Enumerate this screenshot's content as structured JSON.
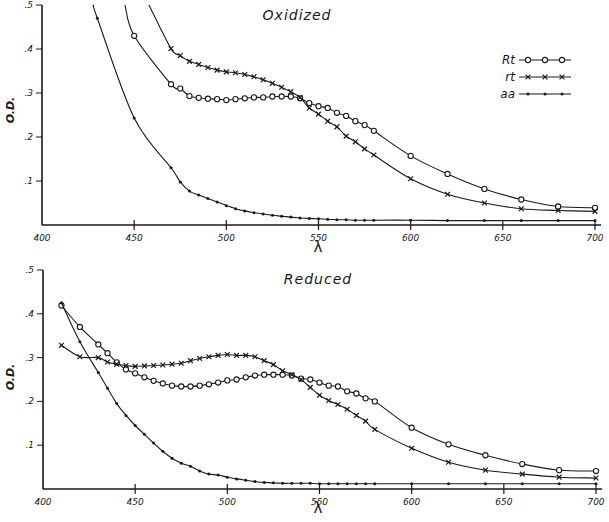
{
  "figure": {
    "panels": [
      {
        "id": "oxidized",
        "title": "Oxidized"
      },
      {
        "id": "reduced",
        "title": "Reduced"
      }
    ],
    "ylabel": "O.D.",
    "xlabel": "λ",
    "legend": [
      {
        "label": "Rt",
        "marker": "circle"
      },
      {
        "label": "rt",
        "marker": "cross"
      },
      {
        "label": "aa",
        "marker": "dot"
      }
    ]
  },
  "chart_data": [
    {
      "type": "line",
      "title": "Oxidized",
      "xlabel": "λ",
      "ylabel": "O.D.",
      "xlim": [
        400,
        700
      ],
      "ylim": [
        0,
        0.5
      ],
      "x_ticks": [
        400,
        450,
        500,
        550,
        600,
        650,
        700
      ],
      "x_tick_labels": [
        "400",
        "450",
        "500",
        "550",
        "600",
        "650",
        "700"
      ],
      "y_ticks": [
        0.1,
        0.2,
        0.3,
        0.4,
        0.5
      ],
      "y_tick_labels": [
        ".1",
        ".2",
        ".3",
        ".4",
        ".5"
      ],
      "grid": false,
      "legend_position": "upper right",
      "series": [
        {
          "name": "Rt",
          "marker": "circle",
          "x": [
            445,
            450,
            470,
            475,
            480,
            485,
            490,
            495,
            500,
            505,
            510,
            515,
            520,
            525,
            530,
            535,
            540,
            545,
            550,
            555,
            560,
            565,
            570,
            575,
            580,
            600,
            620,
            640,
            660,
            680,
            700
          ],
          "y": [
            0.5,
            0.43,
            0.32,
            0.31,
            0.293,
            0.289,
            0.287,
            0.286,
            0.284,
            0.286,
            0.288,
            0.29,
            0.29,
            0.292,
            0.292,
            0.292,
            0.288,
            0.277,
            0.27,
            0.266,
            0.255,
            0.248,
            0.236,
            0.227,
            0.214,
            0.157,
            0.116,
            0.082,
            0.058,
            0.042,
            0.039
          ]
        },
        {
          "name": "rt",
          "marker": "cross",
          "x": [
            458,
            470,
            475,
            480,
            485,
            490,
            495,
            500,
            505,
            510,
            515,
            520,
            525,
            530,
            535,
            540,
            545,
            550,
            555,
            560,
            565,
            570,
            575,
            580,
            600,
            620,
            640,
            660,
            680,
            700
          ],
          "y": [
            0.5,
            0.401,
            0.385,
            0.372,
            0.365,
            0.358,
            0.352,
            0.348,
            0.346,
            0.342,
            0.337,
            0.33,
            0.322,
            0.313,
            0.303,
            0.29,
            0.266,
            0.252,
            0.236,
            0.223,
            0.202,
            0.189,
            0.173,
            0.159,
            0.105,
            0.07,
            0.05,
            0.037,
            0.033,
            0.031
          ]
        },
        {
          "name": "aa",
          "marker": "dot",
          "x": [
            428,
            430,
            450,
            470,
            475,
            480,
            485,
            490,
            495,
            500,
            505,
            510,
            515,
            520,
            525,
            530,
            535,
            540,
            545,
            550,
            555,
            560,
            565,
            570,
            575,
            580,
            600,
            620,
            640,
            660,
            680,
            700
          ],
          "y": [
            0.5,
            0.47,
            0.243,
            0.13,
            0.098,
            0.077,
            0.068,
            0.06,
            0.052,
            0.044,
            0.037,
            0.032,
            0.028,
            0.025,
            0.022,
            0.02,
            0.018,
            0.016,
            0.015,
            0.014,
            0.013,
            0.012,
            0.012,
            0.011,
            0.011,
            0.011,
            0.011,
            0.01,
            0.01,
            0.01,
            0.01,
            0.01
          ]
        }
      ]
    },
    {
      "type": "line",
      "title": "Reduced",
      "xlabel": "λ",
      "ylabel": "O.D.",
      "xlim": [
        400,
        700
      ],
      "ylim": [
        0,
        0.5
      ],
      "x_ticks": [
        400,
        450,
        500,
        550,
        600,
        650,
        700
      ],
      "x_tick_labels": [
        "400",
        "450",
        "500",
        "550",
        "600",
        "650",
        "700"
      ],
      "y_ticks": [
        0.1,
        0.2,
        0.3,
        0.4,
        0.5
      ],
      "y_tick_labels": [
        ".1",
        ".2",
        ".3",
        ".4",
        ".5"
      ],
      "grid": false,
      "series": [
        {
          "name": "Rt",
          "marker": "circle",
          "x": [
            410,
            420,
            430,
            435,
            440,
            445,
            450,
            455,
            460,
            465,
            470,
            475,
            480,
            485,
            490,
            495,
            500,
            505,
            510,
            515,
            520,
            525,
            530,
            535,
            540,
            545,
            550,
            555,
            560,
            565,
            570,
            575,
            580,
            600,
            620,
            640,
            660,
            680,
            700
          ],
          "y": [
            0.419,
            0.37,
            0.33,
            0.31,
            0.289,
            0.273,
            0.264,
            0.255,
            0.247,
            0.241,
            0.236,
            0.234,
            0.234,
            0.236,
            0.239,
            0.243,
            0.248,
            0.25,
            0.255,
            0.259,
            0.261,
            0.261,
            0.261,
            0.259,
            0.252,
            0.25,
            0.243,
            0.236,
            0.234,
            0.223,
            0.218,
            0.207,
            0.2,
            0.14,
            0.102,
            0.077,
            0.057,
            0.043,
            0.041
          ]
        },
        {
          "name": "rt",
          "marker": "cross",
          "x": [
            410,
            420,
            430,
            435,
            440,
            445,
            450,
            455,
            460,
            465,
            470,
            475,
            480,
            485,
            490,
            495,
            500,
            505,
            510,
            515,
            520,
            525,
            530,
            535,
            540,
            545,
            550,
            555,
            560,
            565,
            570,
            575,
            580,
            600,
            620,
            640,
            660,
            680,
            700
          ],
          "y": [
            0.328,
            0.302,
            0.3,
            0.29,
            0.285,
            0.282,
            0.28,
            0.281,
            0.282,
            0.283,
            0.285,
            0.287,
            0.293,
            0.298,
            0.302,
            0.305,
            0.307,
            0.305,
            0.305,
            0.302,
            0.293,
            0.284,
            0.27,
            0.261,
            0.25,
            0.232,
            0.214,
            0.202,
            0.193,
            0.182,
            0.168,
            0.155,
            0.136,
            0.093,
            0.061,
            0.043,
            0.034,
            0.027,
            0.025
          ]
        },
        {
          "name": "aa",
          "marker": "dot",
          "x": [
            410,
            420,
            430,
            435,
            440,
            445,
            450,
            455,
            460,
            465,
            470,
            475,
            480,
            485,
            490,
            495,
            500,
            505,
            510,
            515,
            520,
            525,
            530,
            535,
            540,
            545,
            550,
            555,
            560,
            565,
            570,
            575,
            580,
            600,
            620,
            640,
            660,
            680,
            700
          ],
          "y": [
            0.425,
            0.336,
            0.266,
            0.23,
            0.195,
            0.168,
            0.145,
            0.125,
            0.105,
            0.086,
            0.07,
            0.059,
            0.052,
            0.041,
            0.034,
            0.032,
            0.027,
            0.023,
            0.02,
            0.017,
            0.015,
            0.014,
            0.013,
            0.013,
            0.013,
            0.013,
            0.012,
            0.012,
            0.012,
            0.012,
            0.012,
            0.012,
            0.012,
            0.012,
            0.012,
            0.012,
            0.012,
            0.012,
            0.012
          ]
        }
      ]
    }
  ]
}
